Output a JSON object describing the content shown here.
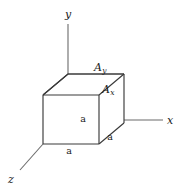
{
  "figure": {
    "kind": "3d-cube-axes-diagram",
    "background_color": "#ffffff",
    "axis_color": "#6b6b6b",
    "edge_color": "#3a3a3a",
    "text_color": "#1a1a1a",
    "width": 178,
    "height": 193
  },
  "axes": {
    "y": {
      "label": "y",
      "label_x": 68,
      "label_y": 14,
      "x1": 68,
      "y1": 24,
      "x2": 68,
      "y2": 74
    },
    "x": {
      "label": "x",
      "label_x": 170,
      "label_y": 120,
      "x1": 124,
      "y1": 120,
      "x2": 163,
      "y2": 120
    },
    "z": {
      "label": "z",
      "label_x": 11,
      "label_y": 179,
      "x1": 43,
      "y1": 144,
      "x2": 20,
      "y2": 170
    }
  },
  "cube": {
    "front_face": {
      "left": 43,
      "top": 95,
      "right": 99,
      "bottom": 144
    },
    "depth_offset": {
      "dx": 25,
      "dy": -21
    },
    "back_face": {
      "left": 68,
      "top": 74,
      "right": 124,
      "bottom": 123
    }
  },
  "dimension_labels": [
    {
      "text": "a",
      "x": 83,
      "y": 119,
      "edge": "vertical-front-center"
    },
    {
      "text": "a",
      "x": 69,
      "y": 151,
      "edge": "bottom-front"
    },
    {
      "text": "a",
      "x": 110,
      "y": 137,
      "edge": "depth-right-bottom"
    }
  ],
  "area_labels": [
    {
      "base": "A",
      "sub": "y",
      "x": 100,
      "y": 67,
      "face": "top"
    },
    {
      "base": "A",
      "sub": "x",
      "x": 108,
      "y": 89,
      "face": "right"
    }
  ]
}
